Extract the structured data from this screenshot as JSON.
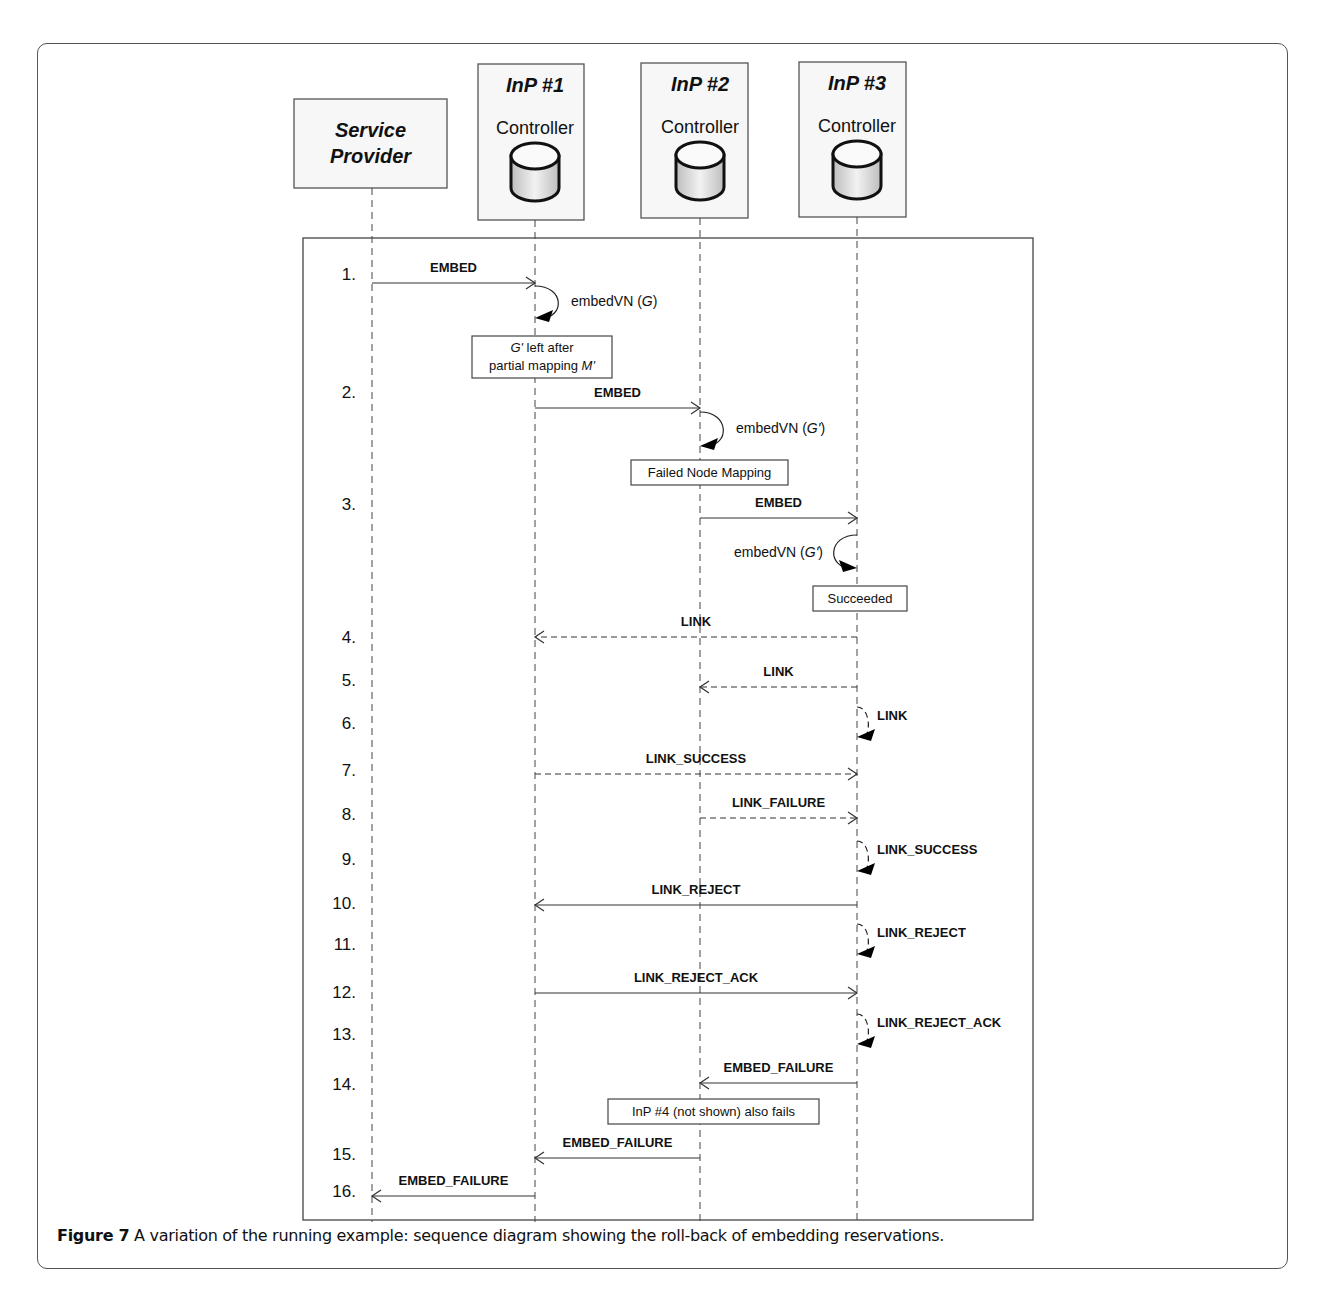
{
  "figure": {
    "label": "Figure 7",
    "caption": " A variation of the running example: sequence diagram showing the roll-back of embedding reservations."
  },
  "participants": [
    {
      "id": "sp",
      "title": "Service",
      "title2": "Provider",
      "subtitle": "",
      "has_db": false
    },
    {
      "id": "inp1",
      "title": "InP #1",
      "title2": "",
      "subtitle": "Controller",
      "has_db": true
    },
    {
      "id": "inp2",
      "title": "InP #2",
      "title2": "",
      "subtitle": "Controller",
      "has_db": true
    },
    {
      "id": "inp3",
      "title": "InP #3",
      "title2": "",
      "subtitle": "Controller",
      "has_db": true
    }
  ],
  "steps": [
    "1.",
    "2.",
    "3.",
    "4.",
    "5.",
    "6.",
    "7.",
    "8.",
    "9.",
    "10.",
    "11.",
    "12.",
    "13.",
    "14.",
    "15.",
    "16."
  ],
  "messages": [
    {
      "step": 1,
      "from": "sp",
      "to": "inp1",
      "label": "EMBED",
      "style": "solid"
    },
    {
      "step": 1,
      "from": "inp1",
      "to": "inp1",
      "label": "embedVN (G)",
      "style": "self-solid",
      "side": "right"
    },
    {
      "step": 2,
      "from": "inp1",
      "to": "inp2",
      "label": "EMBED",
      "style": "solid"
    },
    {
      "step": 2,
      "from": "inp2",
      "to": "inp2",
      "label": "embedVN (G')",
      "style": "self-solid",
      "side": "right"
    },
    {
      "step": 3,
      "from": "inp2",
      "to": "inp3",
      "label": "EMBED",
      "style": "solid"
    },
    {
      "step": 3,
      "from": "inp3",
      "to": "inp3",
      "label": "embedVN (G')",
      "style": "self-solid",
      "side": "left"
    },
    {
      "step": 4,
      "from": "inp3",
      "to": "inp1",
      "label": "LINK",
      "style": "dashed"
    },
    {
      "step": 5,
      "from": "inp3",
      "to": "inp2",
      "label": "LINK",
      "style": "dashed"
    },
    {
      "step": 6,
      "from": "inp3",
      "to": "inp3",
      "label": "LINK",
      "style": "self-dashed",
      "side": "right"
    },
    {
      "step": 7,
      "from": "inp1",
      "to": "inp3",
      "label": "LINK_SUCCESS",
      "style": "dashed"
    },
    {
      "step": 8,
      "from": "inp2",
      "to": "inp3",
      "label": "LINK_FAILURE",
      "style": "dashed"
    },
    {
      "step": 9,
      "from": "inp3",
      "to": "inp3",
      "label": "LINK_SUCCESS",
      "style": "self-dashed",
      "side": "right"
    },
    {
      "step": 10,
      "from": "inp3",
      "to": "inp1",
      "label": "LINK_REJECT",
      "style": "solid"
    },
    {
      "step": 11,
      "from": "inp3",
      "to": "inp3",
      "label": "LINK_REJECT",
      "style": "self-dashed",
      "side": "right"
    },
    {
      "step": 12,
      "from": "inp1",
      "to": "inp3",
      "label": "LINK_REJECT_ACK",
      "style": "solid"
    },
    {
      "step": 13,
      "from": "inp3",
      "to": "inp3",
      "label": "LINK_REJECT_ACK",
      "style": "self-dashed",
      "side": "right"
    },
    {
      "step": 14,
      "from": "inp3",
      "to": "inp2",
      "label": "EMBED_FAILURE",
      "style": "solid"
    },
    {
      "step": 15,
      "from": "inp2",
      "to": "inp1",
      "label": "EMBED_FAILURE",
      "style": "solid"
    },
    {
      "step": 16,
      "from": "inp1",
      "to": "sp",
      "label": "EMBED_FAILURE",
      "style": "solid"
    }
  ],
  "notes": [
    {
      "id": "note-partial-mapping",
      "line1": "G' left after",
      "line2": "partial mapping M'"
    },
    {
      "id": "note-failed-node-mapping",
      "line1": "Failed Node Mapping",
      "line2": ""
    },
    {
      "id": "note-succeeded",
      "line1": "Succeeded",
      "line2": ""
    },
    {
      "id": "note-inp4-fails",
      "line1": "InP #4 (not shown) also fails",
      "line2": ""
    }
  ]
}
